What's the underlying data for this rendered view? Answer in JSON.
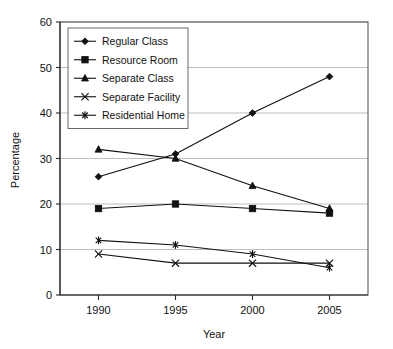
{
  "chart_data": {
    "type": "line",
    "title": "",
    "xlabel": "Year",
    "ylabel": "Percentage",
    "categories": [
      "1990",
      "1995",
      "2000",
      "2005"
    ],
    "x": [
      1990,
      1995,
      2000,
      2005
    ],
    "xlim": [
      1987.5,
      2007.5
    ],
    "ylim": [
      0,
      60
    ],
    "yticks": [
      0,
      10,
      20,
      30,
      40,
      50,
      60
    ],
    "ytick_labels": [
      "0",
      "10",
      "20",
      "30",
      "40",
      "50",
      "60"
    ],
    "xtick_labels": [
      "1990",
      "1995",
      "2000",
      "2005"
    ],
    "grid": "horizontal",
    "legend_position": "top-left-inside",
    "series": [
      {
        "name": "Regular Class",
        "marker": "diamond",
        "values": [
          26,
          31,
          40,
          48
        ]
      },
      {
        "name": "Resource Room",
        "marker": "square",
        "values": [
          19,
          20,
          19,
          18
        ]
      },
      {
        "name": "Separate Class",
        "marker": "triangle",
        "values": [
          32,
          30,
          24,
          19
        ]
      },
      {
        "name": "Separate Facility",
        "marker": "x",
        "values": [
          9,
          7,
          7,
          7
        ]
      },
      {
        "name": "Residential Home",
        "marker": "asterisk",
        "values": [
          12,
          11,
          9,
          6
        ]
      }
    ],
    "colors": {
      "line": "#111111",
      "marker": "#111111",
      "grid": "#b6b6b6",
      "frame": "#5a5a5a",
      "background": "#ffffff"
    }
  }
}
